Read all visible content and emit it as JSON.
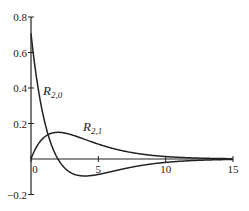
{
  "chart_data": {
    "type": "line",
    "title": "",
    "xlabel": "",
    "ylabel": "",
    "xlim": [
      0,
      15
    ],
    "ylim": [
      -0.2,
      0.8
    ],
    "grid": false,
    "x_ticks": [
      "0",
      "5",
      "10",
      "15"
    ],
    "y_ticks": [
      "-0.2",
      "0.2",
      "0.4",
      "0.6",
      "0.8"
    ],
    "series": [
      {
        "name": "R_{2,0}",
        "label_main": "R",
        "label_sub": "2,0",
        "x": [
          0,
          0.5,
          1,
          1.5,
          2,
          2.5,
          3,
          4,
          5,
          6,
          7,
          8,
          9,
          10,
          12,
          15
        ],
        "values": [
          0.707,
          0.413,
          0.214,
          0.083,
          0.0,
          -0.051,
          -0.079,
          -0.096,
          -0.087,
          -0.07,
          -0.053,
          -0.039,
          -0.028,
          -0.019,
          -0.009,
          -0.002
        ]
      },
      {
        "name": "R_{2,1}",
        "label_main": "R",
        "label_sub": "2,1",
        "x": [
          0,
          0.5,
          1,
          1.5,
          2,
          2.5,
          3,
          4,
          5,
          6,
          7,
          8,
          9,
          10,
          12,
          15
        ],
        "values": [
          0.0,
          0.08,
          0.124,
          0.144,
          0.149,
          0.146,
          0.138,
          0.111,
          0.084,
          0.061,
          0.043,
          0.03,
          0.02,
          0.014,
          0.006,
          0.002
        ]
      }
    ]
  }
}
